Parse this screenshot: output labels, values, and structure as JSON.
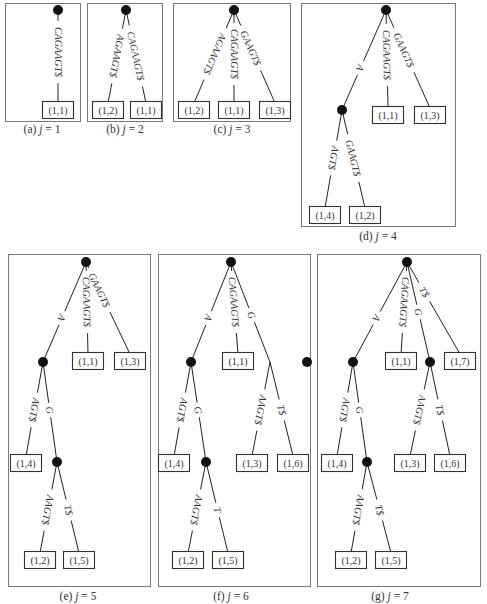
{
  "panels": [
    {
      "id": "a",
      "caption_prefix": "(a) ",
      "caption_var": "j",
      "caption_eq": " = 1",
      "frame": [
        5,
        3,
        75,
        118
      ],
      "caption_pos": [
        42,
        137
      ],
      "nodes": [
        [
          58,
          10
        ]
      ],
      "leaves": [
        {
          "x": 58,
          "y": 110,
          "label": "(1,1)"
        }
      ],
      "edges": [
        {
          "from": [
            58,
            10
          ],
          "to": [
            58,
            103
          ],
          "label": "CAGAAGT$",
          "lx": 62,
          "ly": 52
        }
      ]
    },
    {
      "id": "b",
      "caption_prefix": "(b) ",
      "caption_var": "j",
      "caption_eq": " = 2",
      "frame": [
        87,
        3,
        75,
        118
      ],
      "caption_pos": [
        125,
        137
      ],
      "nodes": [
        [
          126,
          10
        ]
      ],
      "leaves": [
        {
          "x": 108,
          "y": 110,
          "label": "(1,2)"
        },
        {
          "x": 146,
          "y": 110,
          "label": "(1,1)"
        }
      ],
      "edges": [
        {
          "from": [
            126,
            10
          ],
          "to": [
            108,
            103
          ],
          "label": "AGAAGT$",
          "lx": 110,
          "ly": 56
        },
        {
          "from": [
            126,
            10
          ],
          "to": [
            146,
            103
          ],
          "label": "CAGAAGT$",
          "lx": 140,
          "ly": 56
        }
      ]
    },
    {
      "id": "c",
      "caption_prefix": "(c) ",
      "caption_var": "j",
      "caption_eq": " = 3",
      "frame": [
        173,
        3,
        117,
        118
      ],
      "caption_pos": [
        232,
        137
      ],
      "nodes": [
        [
          234,
          10
        ]
      ],
      "leaves": [
        {
          "x": 194,
          "y": 110,
          "label": "(1,2)"
        },
        {
          "x": 234,
          "y": 110,
          "label": "(1,1)"
        },
        {
          "x": 275,
          "y": 110,
          "label": "(1,3)"
        }
      ],
      "edges": [
        {
          "from": [
            234,
            10
          ],
          "to": [
            194,
            103
          ],
          "label": "AGAAGT$",
          "lx": 213,
          "ly": 54
        },
        {
          "from": [
            234,
            10
          ],
          "to": [
            234,
            103
          ],
          "label": "CAGAAGT$",
          "lx": 238,
          "ly": 54
        },
        {
          "from": [
            234,
            10
          ],
          "to": [
            275,
            103
          ],
          "label": "GAAGT$",
          "lx": 259,
          "ly": 48
        }
      ]
    },
    {
      "id": "d",
      "caption_prefix": "(d) ",
      "caption_var": "j",
      "caption_eq": " = 4",
      "frame": [
        301,
        3,
        154,
        223
      ],
      "caption_pos": [
        378,
        244
      ],
      "nodes": [
        [
          386,
          10
        ],
        [
          342,
          110
        ]
      ],
      "leaves": [
        {
          "x": 388,
          "y": 115,
          "label": "(1,1)"
        },
        {
          "x": 430,
          "y": 115,
          "label": "(1,3)"
        },
        {
          "x": 325,
          "y": 215,
          "label": "(1,4)"
        },
        {
          "x": 365,
          "y": 215,
          "label": "(1,2)"
        }
      ],
      "edges": [
        {
          "from": [
            386,
            10
          ],
          "to": [
            342,
            110
          ],
          "label": "A",
          "lx": 360,
          "ly": 68
        },
        {
          "from": [
            386,
            10
          ],
          "to": [
            388,
            108
          ],
          "label": "CAGAAGT$",
          "lx": 392,
          "ly": 55
        },
        {
          "from": [
            386,
            10
          ],
          "to": [
            430,
            108
          ],
          "label": "GAAGT$",
          "lx": 412,
          "ly": 50
        },
        {
          "from": [
            342,
            110
          ],
          "to": [
            325,
            208
          ],
          "label": "AGT$",
          "lx": 330,
          "ly": 158
        },
        {
          "from": [
            342,
            110
          ],
          "to": [
            365,
            208
          ],
          "label": "GAAGT$",
          "lx": 355,
          "ly": 158
        }
      ]
    },
    {
      "id": "e",
      "caption_prefix": "(e) ",
      "caption_var": "j",
      "caption_eq": " = 5",
      "frame": [
        8,
        254,
        142,
        332
      ],
      "caption_pos": [
        78,
        604
      ],
      "nodes": [
        [
          86,
          262
        ],
        [
          43,
          362
        ],
        [
          57,
          462
        ]
      ],
      "leaves": [
        {
          "x": 88,
          "y": 361,
          "label": "(1,1)"
        },
        {
          "x": 130,
          "y": 361,
          "label": "(1,3)"
        },
        {
          "x": 26,
          "y": 463,
          "label": "(1,4)"
        },
        {
          "x": 40,
          "y": 560,
          "label": "(1,2)"
        },
        {
          "x": 79,
          "y": 560,
          "label": "(1,5)"
        }
      ],
      "edges": [
        {
          "from": [
            86,
            262
          ],
          "to": [
            43,
            362
          ],
          "label": "A",
          "lx": 60,
          "ly": 318
        },
        {
          "from": [
            86,
            262
          ],
          "to": [
            88,
            354
          ],
          "label": "CAGAAGT$",
          "lx": 92,
          "ly": 302
        },
        {
          "from": [
            86,
            262
          ],
          "to": [
            130,
            354
          ],
          "label": "GAAGT$",
          "lx": 110,
          "ly": 290
        },
        {
          "from": [
            43,
            362
          ],
          "to": [
            26,
            456
          ],
          "label": "AGT$",
          "lx": 32,
          "ly": 410
        },
        {
          "from": [
            43,
            362
          ],
          "to": [
            57,
            462
          ],
          "label": "G",
          "lx": 53,
          "ly": 410
        },
        {
          "from": [
            57,
            462
          ],
          "to": [
            40,
            553
          ],
          "label": "AAGT$",
          "lx": 44,
          "ly": 510
        },
        {
          "from": [
            57,
            462
          ],
          "to": [
            79,
            553
          ],
          "label": "T$",
          "lx": 66,
          "ly": 510
        }
      ]
    },
    {
      "id": "f",
      "caption_prefix": "(f) ",
      "caption_var": "j",
      "caption_eq": " = 6",
      "frame": [
        158,
        254,
        152,
        332
      ],
      "caption_pos": [
        231,
        604
      ],
      "nodes": [
        [
          231,
          262
        ],
        [
          191,
          362
        ],
        [
          307,
          362
        ],
        [
          206,
          462
        ]
      ],
      "leaves": [
        {
          "x": 238,
          "y": 361,
          "label": "(1,1)"
        },
        {
          "x": 174,
          "y": 463,
          "label": "(1,4)"
        },
        {
          "x": 252,
          "y": 463,
          "label": "(1,3)"
        },
        {
          "x": 293,
          "y": 463,
          "label": "(1,6)"
        },
        {
          "x": 188,
          "y": 560,
          "label": "(1,2)"
        },
        {
          "x": 228,
          "y": 560,
          "label": "(1,5)"
        }
      ],
      "edges": [
        {
          "from": [
            231,
            262
          ],
          "to": [
            191,
            362
          ],
          "label": "A",
          "lx": 208,
          "ly": 318
        },
        {
          "from": [
            231,
            262
          ],
          "to": [
            238,
            354
          ],
          "label": "CAGAAGT$",
          "lx": 240,
          "ly": 302
        },
        {
          "from": [
            231,
            262
          ],
          "to": [
            270,
            362
          ],
          "label": "G",
          "lx": 250,
          "ly": 315
        },
        {
          "from": [
            191,
            362
          ],
          "to": [
            174,
            456
          ],
          "label": "AGT$",
          "lx": 180,
          "ly": 410
        },
        {
          "from": [
            191,
            362
          ],
          "to": [
            206,
            462
          ],
          "label": "G",
          "lx": 200,
          "ly": 410
        },
        {
          "from": [
            270,
            362
          ],
          "to": [
            252,
            456
          ],
          "label": "AAGT$",
          "lx": 258,
          "ly": 410
        },
        {
          "from": [
            270,
            362
          ],
          "to": [
            293,
            456
          ],
          "label": "T$",
          "lx": 282,
          "ly": 410
        },
        {
          "from": [
            206,
            462
          ],
          "to": [
            188,
            553
          ],
          "label": "AAGT$",
          "lx": 193,
          "ly": 510
        },
        {
          "from": [
            206,
            462
          ],
          "to": [
            228,
            553
          ],
          "label": "T",
          "lx": 218,
          "ly": 510
        }
      ]
    },
    {
      "id": "g",
      "caption_prefix": "(g) ",
      "caption_var": "j",
      "caption_eq": " = 7",
      "frame": [
        317,
        254,
        163,
        332
      ],
      "caption_pos": [
        390,
        604
      ],
      "nodes": [
        [
          407,
          262
        ],
        [
          353,
          362
        ],
        [
          430,
          362
        ],
        [
          367,
          462
        ]
      ],
      "leaves": [
        {
          "x": 401,
          "y": 361,
          "label": "(1,1)"
        },
        {
          "x": 460,
          "y": 361,
          "label": "(1,7)"
        },
        {
          "x": 337,
          "y": 463,
          "label": "(1,4)"
        },
        {
          "x": 410,
          "y": 463,
          "label": "(1,3)"
        },
        {
          "x": 450,
          "y": 463,
          "label": "(1,6)"
        },
        {
          "x": 351,
          "y": 560,
          "label": "(1,2)"
        },
        {
          "x": 391,
          "y": 560,
          "label": "(1,5)"
        }
      ],
      "edges": [
        {
          "from": [
            407,
            262
          ],
          "to": [
            353,
            362
          ],
          "label": "A",
          "lx": 375,
          "ly": 318
        },
        {
          "from": [
            407,
            262
          ],
          "to": [
            401,
            354
          ],
          "label": "CAGAAGT$",
          "lx": 405,
          "ly": 302
        },
        {
          "from": [
            407,
            262
          ],
          "to": [
            430,
            362
          ],
          "label": "G",
          "lx": 420,
          "ly": 312
        },
        {
          "from": [
            407,
            262
          ],
          "to": [
            460,
            354
          ],
          "label": "T$",
          "lx": 432,
          "ly": 292
        },
        {
          "from": [
            353,
            362
          ],
          "to": [
            337,
            456
          ],
          "label": "AGT$",
          "lx": 342,
          "ly": 410
        },
        {
          "from": [
            353,
            362
          ],
          "to": [
            367,
            462
          ],
          "label": "G",
          "lx": 362,
          "ly": 410
        },
        {
          "from": [
            430,
            362
          ],
          "to": [
            410,
            456
          ],
          "label": "AAGT$",
          "lx": 417,
          "ly": 410
        },
        {
          "from": [
            430,
            362
          ],
          "to": [
            450,
            456
          ],
          "label": "T$",
          "lx": 441,
          "ly": 410
        },
        {
          "from": [
            367,
            462
          ],
          "to": [
            351,
            553
          ],
          "label": "AAGT$",
          "lx": 356,
          "ly": 510
        },
        {
          "from": [
            367,
            462
          ],
          "to": [
            391,
            553
          ],
          "label": "T$",
          "lx": 380,
          "ly": 510
        }
      ]
    }
  ]
}
